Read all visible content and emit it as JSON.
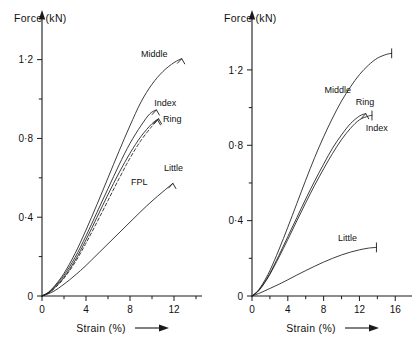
{
  "figure": {
    "background": "#ffffff",
    "ink": "#1a1a1a"
  },
  "chart_data": [
    {
      "type": "line",
      "panel": "left",
      "title": "",
      "xlabel": "Strain (%)",
      "ylabel": "Force (kN)",
      "xlim": [
        0,
        14
      ],
      "ylim": [
        0,
        1.32
      ],
      "xticks": [
        0,
        4,
        8,
        12
      ],
      "xtick_labels": [
        "0",
        "4",
        "8",
        "12"
      ],
      "xminor": [
        2,
        6,
        10,
        14
      ],
      "yticks": [
        0,
        0.4,
        0.8,
        1.2
      ],
      "ytick_labels": [
        "0",
        "0·4",
        "0·8",
        "1·2"
      ],
      "yminor": [
        0.2,
        0.6,
        1.0
      ],
      "grid": false,
      "legend": "inline-annotations",
      "series": [
        {
          "name": "Middle",
          "style": "solid",
          "label": "Middle",
          "label_x": 9.0,
          "label_y": 1.215,
          "points": [
            [
              0.0,
              0.0
            ],
            [
              0.6,
              0.02
            ],
            [
              1.2,
              0.055
            ],
            [
              2.0,
              0.115
            ],
            [
              3.0,
              0.215
            ],
            [
              4.0,
              0.335
            ],
            [
              5.0,
              0.465
            ],
            [
              6.0,
              0.6
            ],
            [
              7.0,
              0.735
            ],
            [
              8.0,
              0.865
            ],
            [
              9.0,
              0.985
            ],
            [
              10.0,
              1.075
            ],
            [
              11.0,
              1.14
            ],
            [
              12.0,
              1.185
            ],
            [
              12.7,
              1.205
            ]
          ]
        },
        {
          "name": "Index",
          "style": "solid",
          "label": "Index",
          "label_x": 10.2,
          "label_y": 0.965,
          "points": [
            [
              0.0,
              0.0
            ],
            [
              0.6,
              0.018
            ],
            [
              1.2,
              0.05
            ],
            [
              2.0,
              0.105
            ],
            [
              3.0,
              0.195
            ],
            [
              4.0,
              0.305
            ],
            [
              5.0,
              0.425
            ],
            [
              6.0,
              0.545
            ],
            [
              7.0,
              0.665
            ],
            [
              8.0,
              0.775
            ],
            [
              9.0,
              0.865
            ],
            [
              9.8,
              0.925
            ],
            [
              10.4,
              0.945
            ]
          ]
        },
        {
          "name": "Ring",
          "style": "solid",
          "label": "Ring",
          "label_x": 11.0,
          "label_y": 0.885,
          "points": [
            [
              0.0,
              0.0
            ],
            [
              0.6,
              0.016
            ],
            [
              1.2,
              0.045
            ],
            [
              2.0,
              0.095
            ],
            [
              3.0,
              0.18
            ],
            [
              4.0,
              0.285
            ],
            [
              5.0,
              0.4
            ],
            [
              6.0,
              0.515
            ],
            [
              7.0,
              0.625
            ],
            [
              8.0,
              0.725
            ],
            [
              9.0,
              0.81
            ],
            [
              10.0,
              0.875
            ],
            [
              10.6,
              0.9
            ]
          ]
        },
        {
          "name": "FPL",
          "style": "dashed",
          "label": "FPL",
          "label_x": 8.1,
          "label_y": 0.565,
          "points": [
            [
              0.0,
              0.0
            ],
            [
              0.6,
              0.015
            ],
            [
              1.2,
              0.042
            ],
            [
              2.0,
              0.09
            ],
            [
              3.0,
              0.17
            ],
            [
              4.0,
              0.268
            ],
            [
              5.0,
              0.375
            ],
            [
              6.0,
              0.485
            ],
            [
              7.0,
              0.595
            ],
            [
              8.0,
              0.7
            ],
            [
              9.0,
              0.79
            ],
            [
              10.0,
              0.862
            ],
            [
              10.5,
              0.895
            ]
          ]
        },
        {
          "name": "Little",
          "style": "solid",
          "label": "Little",
          "label_x": 11.1,
          "label_y": 0.635,
          "points": [
            [
              0.0,
              0.0
            ],
            [
              1.0,
              0.022
            ],
            [
              2.0,
              0.06
            ],
            [
              3.0,
              0.105
            ],
            [
              4.0,
              0.155
            ],
            [
              5.0,
              0.21
            ],
            [
              6.0,
              0.265
            ],
            [
              7.0,
              0.32
            ],
            [
              8.0,
              0.375
            ],
            [
              9.0,
              0.43
            ],
            [
              10.0,
              0.482
            ],
            [
              11.0,
              0.53
            ],
            [
              11.9,
              0.572
            ]
          ]
        }
      ]
    },
    {
      "type": "line",
      "panel": "right",
      "title": "",
      "xlabel": "Strain (%)",
      "ylabel": "Force (kN)",
      "xlim": [
        0,
        17.2
      ],
      "ylim": [
        0,
        1.38
      ],
      "xticks": [
        0,
        4,
        8,
        12,
        16
      ],
      "xtick_labels": [
        "0",
        "4",
        "8",
        "12",
        "16"
      ],
      "xminor": [
        2,
        6,
        10,
        14
      ],
      "yticks": [
        0,
        0.4,
        0.8,
        1.2
      ],
      "ytick_labels": [
        "0",
        "0·4",
        "0·8",
        "1·2"
      ],
      "yminor": [
        0.2,
        0.6,
        1.0
      ],
      "grid": false,
      "legend": "inline-annotations",
      "series": [
        {
          "name": "Middle",
          "style": "solid",
          "label": "Middle",
          "label_x": 8.1,
          "label_y": 1.075,
          "points": [
            [
              0.0,
              0.0
            ],
            [
              0.6,
              0.025
            ],
            [
              1.2,
              0.065
            ],
            [
              2.0,
              0.135
            ],
            [
              3.0,
              0.245
            ],
            [
              4.0,
              0.365
            ],
            [
              5.0,
              0.49
            ],
            [
              6.0,
              0.615
            ],
            [
              7.0,
              0.735
            ],
            [
              8.0,
              0.845
            ],
            [
              9.0,
              0.945
            ],
            [
              10.0,
              1.035
            ],
            [
              11.0,
              1.11
            ],
            [
              12.0,
              1.175
            ],
            [
              13.0,
              1.225
            ],
            [
              14.0,
              1.262
            ],
            [
              15.0,
              1.282
            ],
            [
              15.6,
              1.288
            ]
          ]
        },
        {
          "name": "Ring",
          "style": "solid",
          "label": "Ring",
          "label_x": 11.6,
          "label_y": 1.015,
          "points": [
            [
              0.0,
              0.0
            ],
            [
              0.6,
              0.022
            ],
            [
              1.2,
              0.058
            ],
            [
              2.0,
              0.12
            ],
            [
              3.0,
              0.215
            ],
            [
              4.0,
              0.315
            ],
            [
              5.0,
              0.415
            ],
            [
              6.0,
              0.515
            ],
            [
              7.0,
              0.61
            ],
            [
              8.0,
              0.7
            ],
            [
              9.0,
              0.785
            ],
            [
              10.0,
              0.855
            ],
            [
              11.0,
              0.915
            ],
            [
              12.0,
              0.955
            ],
            [
              12.7,
              0.968
            ]
          ]
        },
        {
          "name": "Index",
          "style": "solid",
          "label": "Index",
          "label_x": 12.7,
          "label_y": 0.875,
          "points": [
            [
              0.0,
              0.0
            ],
            [
              0.6,
              0.021
            ],
            [
              1.2,
              0.055
            ],
            [
              2.0,
              0.115
            ],
            [
              3.0,
              0.205
            ],
            [
              4.0,
              0.3
            ],
            [
              5.0,
              0.398
            ],
            [
              6.0,
              0.495
            ],
            [
              7.0,
              0.588
            ],
            [
              8.0,
              0.675
            ],
            [
              9.0,
              0.757
            ],
            [
              10.0,
              0.83
            ],
            [
              11.0,
              0.89
            ],
            [
              12.0,
              0.935
            ],
            [
              13.0,
              0.955
            ],
            [
              13.4,
              0.958
            ]
          ]
        },
        {
          "name": "Little",
          "style": "solid",
          "label": "Little",
          "label_x": 9.6,
          "label_y": 0.29,
          "points": [
            [
              0.0,
              0.0
            ],
            [
              1.0,
              0.018
            ],
            [
              2.0,
              0.04
            ],
            [
              3.0,
              0.062
            ],
            [
              4.0,
              0.086
            ],
            [
              5.0,
              0.111
            ],
            [
              6.0,
              0.135
            ],
            [
              7.0,
              0.158
            ],
            [
              8.0,
              0.18
            ],
            [
              9.0,
              0.2
            ],
            [
              10.0,
              0.218
            ],
            [
              11.0,
              0.233
            ],
            [
              12.0,
              0.245
            ],
            [
              13.0,
              0.254
            ],
            [
              13.9,
              0.258
            ]
          ]
        }
      ]
    }
  ]
}
